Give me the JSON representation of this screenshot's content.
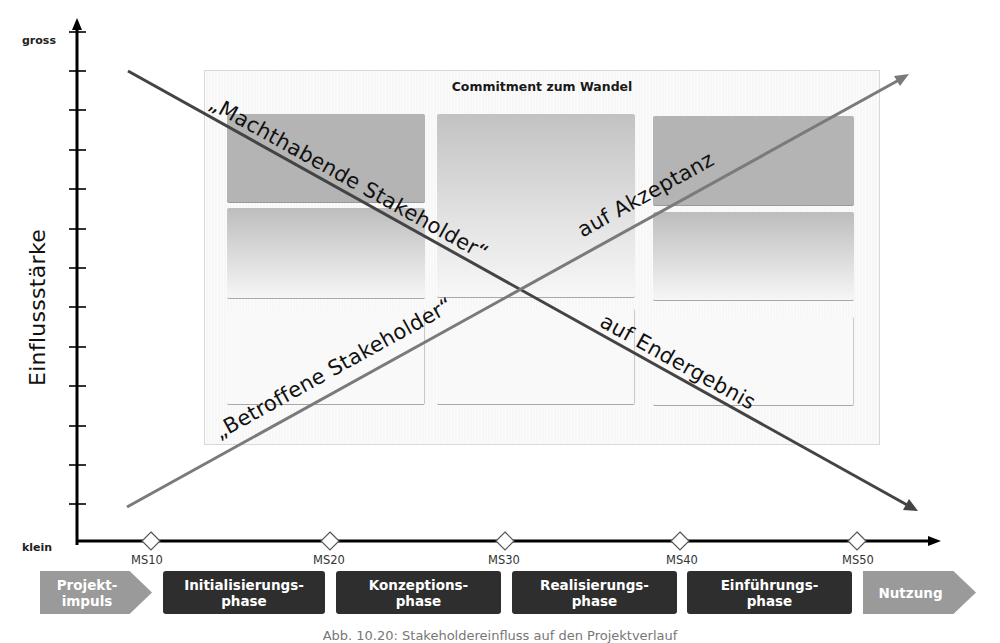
{
  "diagram": {
    "y_axis": {
      "title": "Einflussstärke",
      "top_label": "gross",
      "bottom_label": "klein",
      "tick_count": 13
    },
    "panel": {
      "title": "Commitment zum Wandel"
    },
    "lines": {
      "falling": {
        "label_part1": "„Machthabende Stakeholder“",
        "label_part2": "auf Endergebnis",
        "color": "#444444"
      },
      "rising": {
        "label_part1": "„Betroffene Stakeholder“",
        "label_part2": "auf Akzeptanz",
        "color": "#7a7a7a"
      }
    },
    "milestones": [
      {
        "label": "MS10",
        "x": 151
      },
      {
        "label": "MS20",
        "x": 330
      },
      {
        "label": "MS30",
        "x": 505
      },
      {
        "label": "MS40",
        "x": 680
      },
      {
        "label": "MS50",
        "x": 857
      }
    ],
    "phases": [
      {
        "line1": "Projekt-",
        "line2": "impuls",
        "style": "grey-arrow"
      },
      {
        "line1": "Initialisierungs-",
        "line2": "phase",
        "style": "dark"
      },
      {
        "line1": "Konzeptions-",
        "line2": "phase",
        "style": "dark"
      },
      {
        "line1": "Realisierungs-",
        "line2": "phase",
        "style": "dark"
      },
      {
        "line1": "Einführungs-",
        "line2": "phase",
        "style": "dark"
      },
      {
        "line1": "Nutzung",
        "line2": "",
        "style": "grey-arrow"
      }
    ],
    "caption": "Abb. 10.20: Stakeholdereinfluss auf den Projektverlauf",
    "colors": {
      "dark_phase": "#2e2e2e",
      "grey_phase": "#9a9a9a",
      "axis": "#000000"
    }
  }
}
